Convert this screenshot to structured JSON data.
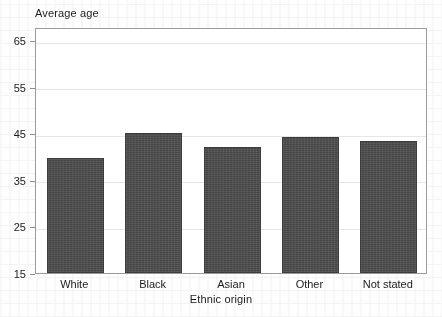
{
  "chart_data": {
    "type": "bar",
    "title": "",
    "xlabel": "Ethnic origin",
    "ylabel": "Average age",
    "categories": [
      "White",
      "Black",
      "Asian",
      "Other",
      "Not stated"
    ],
    "values": [
      39.8,
      45.1,
      42.2,
      44.2,
      43.4
    ],
    "ylim": [
      15,
      68
    ],
    "yticks": [
      15,
      25,
      35,
      45,
      55,
      65
    ],
    "grid": true,
    "legend": "none",
    "series": [
      {
        "name": "Average age",
        "values": [
          39.8,
          45.1,
          42.2,
          44.2,
          43.4
        ]
      }
    ],
    "bar_color": "#4d4d4d",
    "frame_color": "#9a9a9a",
    "grid_color": "#e6e6e6",
    "background_color": "#ffffff"
  }
}
